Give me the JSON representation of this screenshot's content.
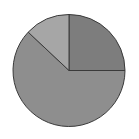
{
  "chart_data": {
    "type": "pie",
    "title": "",
    "start_angle_deg": 0,
    "direction": "clockwise",
    "categories": [
      "Slice A",
      "Slice B",
      "Slice C"
    ],
    "values": [
      25,
      62,
      13
    ],
    "colors": [
      "#7d7d7d",
      "#8e8e8e",
      "#a6a6a6"
    ],
    "stroke_color": "#3a3a3a",
    "legend": "none",
    "labels_visible": false
  },
  "layout": {
    "cx": 69,
    "cy": 70.5,
    "r": 56
  }
}
